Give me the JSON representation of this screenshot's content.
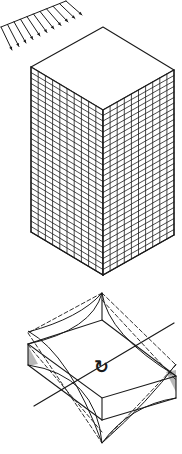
{
  "figure": {
    "background": "#ffffff",
    "ink": "#1a1a1a",
    "shade": "#9a9a9a",
    "wind_load": {
      "label": "distributed lateral load arrows",
      "arrow_count": 11,
      "start": [
        42,
        40
      ],
      "end": [
        3,
        19
      ],
      "offset": [
        39,
        -22
      ]
    },
    "building": {
      "label": "isometric high-rise block with facade grid",
      "top": [
        103,
        27
      ],
      "left": [
        31,
        67
      ],
      "right": [
        174,
        70
      ],
      "front": [
        103,
        110
      ],
      "height": 165,
      "left_face_columns": 10,
      "right_face_columns": 10,
      "rows": 30
    },
    "torsion_detail": {
      "label": "floor slab warping under torsion",
      "top_cusp": [
        102,
        293
      ],
      "bottom_cusp": [
        102,
        443
      ],
      "axis_start": [
        34,
        406
      ],
      "axis_end": [
        174,
        323
      ],
      "rotation_symbol": "↻"
    }
  }
}
